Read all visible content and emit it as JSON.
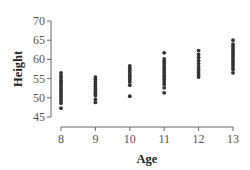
{
  "chart_data": {
    "type": "scatter",
    "title": "",
    "xlabel": "Age",
    "ylabel": "Height",
    "xlim": [
      8,
      13
    ],
    "ylim": [
      45,
      70
    ],
    "x_ticks": [
      8,
      9,
      10,
      11,
      12,
      13
    ],
    "y_ticks": [
      45,
      50,
      55,
      60,
      65,
      70
    ],
    "grid": false,
    "legend": null,
    "colors": {
      "points": "#333333",
      "axis": "#666666",
      "text": "#555555"
    },
    "series": [
      {
        "name": "Height vs Age",
        "points": [
          {
            "x": 8,
            "y": 56.5
          },
          {
            "x": 8,
            "y": 55.8
          },
          {
            "x": 8,
            "y": 55.2
          },
          {
            "x": 8,
            "y": 54.6
          },
          {
            "x": 8,
            "y": 54.0
          },
          {
            "x": 8,
            "y": 53.4
          },
          {
            "x": 8,
            "y": 52.8
          },
          {
            "x": 8,
            "y": 52.2
          },
          {
            "x": 8,
            "y": 51.6
          },
          {
            "x": 8,
            "y": 51.0
          },
          {
            "x": 8,
            "y": 50.4
          },
          {
            "x": 8,
            "y": 49.8
          },
          {
            "x": 8,
            "y": 49.2
          },
          {
            "x": 8,
            "y": 48.6
          },
          {
            "x": 8,
            "y": 47.3
          },
          {
            "x": 9,
            "y": 55.4
          },
          {
            "x": 9,
            "y": 54.8
          },
          {
            "x": 9,
            "y": 54.2
          },
          {
            "x": 9,
            "y": 53.6
          },
          {
            "x": 9,
            "y": 53.0
          },
          {
            "x": 9,
            "y": 52.4
          },
          {
            "x": 9,
            "y": 51.8
          },
          {
            "x": 9,
            "y": 51.2
          },
          {
            "x": 9,
            "y": 50.6
          },
          {
            "x": 9,
            "y": 49.6
          },
          {
            "x": 9,
            "y": 48.8
          },
          {
            "x": 10,
            "y": 58.3
          },
          {
            "x": 10,
            "y": 57.7
          },
          {
            "x": 10,
            "y": 57.1
          },
          {
            "x": 10,
            "y": 56.5
          },
          {
            "x": 10,
            "y": 55.9
          },
          {
            "x": 10,
            "y": 55.3
          },
          {
            "x": 10,
            "y": 54.7
          },
          {
            "x": 10,
            "y": 54.1
          },
          {
            "x": 10,
            "y": 53.3
          },
          {
            "x": 10,
            "y": 50.4
          },
          {
            "x": 11,
            "y": 61.7
          },
          {
            "x": 11,
            "y": 60.1
          },
          {
            "x": 11,
            "y": 59.5
          },
          {
            "x": 11,
            "y": 58.9
          },
          {
            "x": 11,
            "y": 58.3
          },
          {
            "x": 11,
            "y": 57.7
          },
          {
            "x": 11,
            "y": 57.1
          },
          {
            "x": 11,
            "y": 56.5
          },
          {
            "x": 11,
            "y": 55.9
          },
          {
            "x": 11,
            "y": 55.3
          },
          {
            "x": 11,
            "y": 54.7
          },
          {
            "x": 11,
            "y": 54.1
          },
          {
            "x": 11,
            "y": 53.5
          },
          {
            "x": 11,
            "y": 52.6
          },
          {
            "x": 11,
            "y": 51.3
          },
          {
            "x": 12,
            "y": 62.3
          },
          {
            "x": 12,
            "y": 61.3
          },
          {
            "x": 12,
            "y": 60.5
          },
          {
            "x": 12,
            "y": 59.7
          },
          {
            "x": 12,
            "y": 58.9
          },
          {
            "x": 12,
            "y": 58.1
          },
          {
            "x": 12,
            "y": 57.4
          },
          {
            "x": 12,
            "y": 56.7
          },
          {
            "x": 12,
            "y": 56.0
          },
          {
            "x": 12,
            "y": 55.4
          },
          {
            "x": 13,
            "y": 65.0
          },
          {
            "x": 13,
            "y": 64.0
          },
          {
            "x": 13,
            "y": 63.4
          },
          {
            "x": 13,
            "y": 62.8
          },
          {
            "x": 13,
            "y": 62.2
          },
          {
            "x": 13,
            "y": 61.6
          },
          {
            "x": 13,
            "y": 61.0
          },
          {
            "x": 13,
            "y": 60.4
          },
          {
            "x": 13,
            "y": 59.8
          },
          {
            "x": 13,
            "y": 59.2
          },
          {
            "x": 13,
            "y": 58.6
          },
          {
            "x": 13,
            "y": 58.0
          },
          {
            "x": 13,
            "y": 57.4
          },
          {
            "x": 13,
            "y": 56.5
          }
        ]
      }
    ]
  }
}
